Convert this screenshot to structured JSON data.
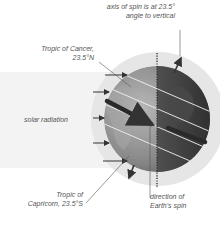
{
  "diagram": {
    "labels": {
      "axis_line1": "axis of spin is at 23.5°",
      "axis_line2": "angle to vertical",
      "cancer_line1": "Tropic of Cancer,",
      "cancer_line2": "23.5°N",
      "solar": "solar radiation",
      "capricorn_line1": "Tropic of",
      "capricorn_line2": "Capricorn, 23.5°S",
      "spin_line1": "direction of",
      "spin_line2": "Earth's spin"
    },
    "values": {
      "tilt_degrees": 23.5,
      "tropic_cancer_lat": "23.5°N",
      "tropic_capricorn_lat": "23.5°S"
    },
    "colors": {
      "halo": "#e6e6e6",
      "radiation_band": "#f3f3f3",
      "globe_light": "#9a9a9a",
      "globe_dark": "#3c3c3c",
      "arrow": "#333333",
      "text": "#555555"
    }
  }
}
